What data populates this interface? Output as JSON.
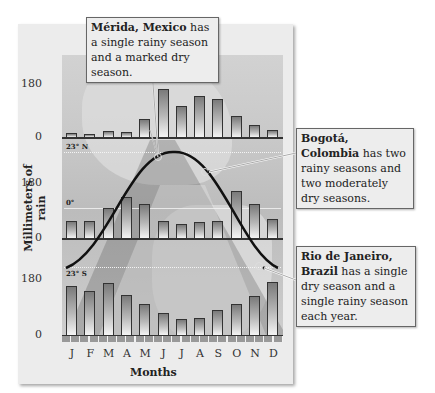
{
  "chart_data": [
    {
      "type": "bar",
      "title": "Mérida, Mexico",
      "categories": [
        "J",
        "F",
        "M",
        "A",
        "M",
        "J",
        "J",
        "A",
        "S",
        "O",
        "N",
        "D"
      ],
      "values": [
        15,
        10,
        20,
        17,
        60,
        163,
        105,
        140,
        130,
        72,
        40,
        25
      ],
      "xlabel": "Months",
      "ylabel": "Millimeters of rain",
      "ylim": [
        0,
        180
      ],
      "yticks": [
        0,
        180
      ]
    },
    {
      "type": "bar",
      "title": "Bogotá, Colombia",
      "categories": [
        "J",
        "F",
        "M",
        "A",
        "M",
        "J",
        "J",
        "A",
        "S",
        "O",
        "N",
        "D"
      ],
      "values": [
        57,
        55,
        98,
        135,
        110,
        55,
        45,
        52,
        55,
        155,
        110,
        62
      ],
      "xlabel": "Months",
      "ylabel": "Millimeters of rain",
      "ylim": [
        0,
        180
      ],
      "yticks": [
        0,
        180
      ]
    },
    {
      "type": "bar",
      "title": "Rio de Janeiro, Brazil",
      "categories": [
        "J",
        "F",
        "M",
        "A",
        "M",
        "J",
        "J",
        "A",
        "S",
        "O",
        "N",
        "D"
      ],
      "values": [
        158,
        142,
        168,
        129,
        100,
        71,
        51,
        55,
        80,
        100,
        125,
        171
      ],
      "xlabel": "Months",
      "ylabel": "Millimeters of rain",
      "ylim": [
        0,
        180
      ],
      "yticks": [
        0,
        180
      ]
    }
  ],
  "axis": {
    "ylabel": "Millimeters of rain",
    "xlabel": "Months",
    "months": [
      "J",
      "F",
      "M",
      "A",
      "M",
      "J",
      "J",
      "A",
      "S",
      "O",
      "N",
      "D"
    ],
    "tick_180": "180",
    "tick_0": "0"
  },
  "latitudes": {
    "north": "23° N",
    "equator": "0°",
    "south": "23° S"
  },
  "callouts": {
    "merida": {
      "place": "Mérida, Mexico",
      "text": " has a single rainy season and a marked dry season."
    },
    "bogota": {
      "place": "Bogotá, Colombia",
      "text": " has two rainy seasons and two moderately dry seasons."
    },
    "rio": {
      "place_line1": "Rio de Janeiro,",
      "place_line2": "Brazil",
      "text": " has a single dry season and a single rainy season each year."
    }
  },
  "colors": {
    "panel": "#ececec",
    "bar_top": "#7a7a7a",
    "bar_bottom": "#f4f4f4",
    "sun_path": "#111111"
  }
}
